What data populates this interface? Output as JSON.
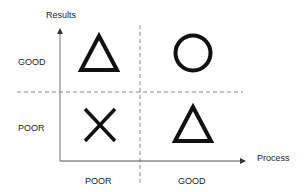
{
  "diagram": {
    "type": "quadrant_matrix",
    "y_axis": {
      "label": "Results",
      "ticks": [
        "GOOD",
        "POOR"
      ]
    },
    "x_axis": {
      "label": "Process",
      "ticks": [
        "POOR",
        "GOOD"
      ]
    },
    "quadrants": [
      {
        "process": "POOR",
        "results": "GOOD",
        "symbol": "triangle"
      },
      {
        "process": "GOOD",
        "results": "GOOD",
        "symbol": "circle"
      },
      {
        "process": "POOR",
        "results": "POOR",
        "symbol": "cross"
      },
      {
        "process": "GOOD",
        "results": "POOR",
        "symbol": "triangle"
      }
    ],
    "colors": {
      "axis": "#777777",
      "divider": "#888888",
      "symbol": "#111111",
      "text": "#222222"
    }
  }
}
